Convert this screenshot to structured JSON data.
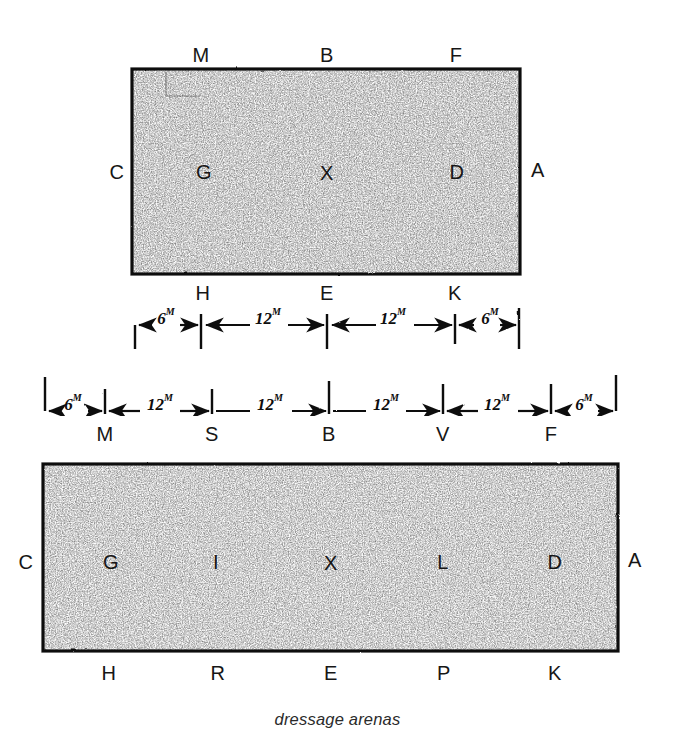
{
  "figure": {
    "caption": "dressage arenas",
    "caption_y": 718
  },
  "arena_small": {
    "name": "20m x 40m short dressage arena",
    "rect": {
      "x": 132,
      "y": 69,
      "w": 388,
      "h": 205
    },
    "letters_top": [
      {
        "label": "M",
        "x": 201,
        "y": 55
      },
      {
        "label": "B",
        "x": 327,
        "y": 55
      },
      {
        "label": "F",
        "x": 456,
        "y": 55
      }
    ],
    "letters_middle": [
      {
        "label": "C",
        "x": 117,
        "y": 172
      },
      {
        "label": "G",
        "x": 204,
        "y": 172
      },
      {
        "label": "X",
        "x": 327,
        "y": 173
      },
      {
        "label": "D",
        "x": 457,
        "y": 172
      },
      {
        "label": "A",
        "x": 538,
        "y": 170
      }
    ],
    "letters_bottom": [
      {
        "label": "H",
        "x": 203,
        "y": 293
      },
      {
        "label": "E",
        "x": 327,
        "y": 293
      },
      {
        "label": "K",
        "x": 455,
        "y": 293
      }
    ]
  },
  "arena_large": {
    "name": "20m x 60m standard dressage arena",
    "rect": {
      "x": 43,
      "y": 464,
      "w": 575,
      "h": 187
    },
    "letters_middle": [
      {
        "label": "C",
        "x": 26,
        "y": 562
      },
      {
        "label": "G",
        "x": 111,
        "y": 562
      },
      {
        "label": "I",
        "x": 216,
        "y": 562
      },
      {
        "label": "X",
        "x": 331,
        "y": 563
      },
      {
        "label": "L",
        "x": 443,
        "y": 562
      },
      {
        "label": "D",
        "x": 555,
        "y": 562
      },
      {
        "label": "A",
        "x": 635,
        "y": 560
      }
    ],
    "letters_bottom": [
      {
        "label": "H",
        "x": 109,
        "y": 673
      },
      {
        "label": "R",
        "x": 218,
        "y": 673
      },
      {
        "label": "E",
        "x": 331,
        "y": 673
      },
      {
        "label": "P",
        "x": 444,
        "y": 673
      },
      {
        "label": "K",
        "x": 555,
        "y": 673
      }
    ]
  },
  "dimension_row_short": {
    "name": "short-arena-long-side-dimensions",
    "baseline_y": 325,
    "ticks_x": [
      135,
      201,
      327,
      455,
      519
    ],
    "tick_dir": "down",
    "tick_len": 22,
    "segments": [
      {
        "value": "6",
        "unit": "M",
        "x1": 135,
        "x2": 201,
        "label_x": 166,
        "label_y": 318
      },
      {
        "value": "12",
        "unit": "M",
        "x1": 201,
        "x2": 327,
        "label_x": 268,
        "label_y": 318
      },
      {
        "value": "12",
        "unit": "M",
        "x1": 327,
        "x2": 455,
        "label_x": 393,
        "label_y": 318
      },
      {
        "value": "6",
        "unit": "M",
        "x1": 455,
        "x2": 519,
        "label_x": 490,
        "label_y": 318
      }
    ],
    "letters_above": [
      {
        "label": "H",
        "x": 203,
        "y": 293
      },
      {
        "label": "E",
        "x": 327,
        "y": 293
      },
      {
        "label": "K",
        "x": 455,
        "y": 293
      }
    ]
  },
  "dimension_row_long": {
    "name": "long-arena-long-side-dimensions",
    "baseline_y": 411,
    "ticks_x": [
      45,
      105,
      212,
      329,
      443,
      551,
      616
    ],
    "tick_dir": "up",
    "tick_len": 34,
    "segments": [
      {
        "value": "6",
        "unit": "M",
        "x1": 45,
        "x2": 105,
        "label_x": 73,
        "label_y": 404
      },
      {
        "value": "12",
        "unit": "M",
        "x1": 105,
        "x2": 212,
        "label_x": 160,
        "label_y": 404
      },
      {
        "value": "12",
        "unit": "M",
        "x1": 212,
        "x2": 329,
        "label_x": 270,
        "label_y": 404
      },
      {
        "value": "12",
        "unit": "M",
        "x1": 329,
        "x2": 443,
        "label_x": 386,
        "label_y": 404
      },
      {
        "value": "12",
        "unit": "M",
        "x1": 443,
        "x2": 551,
        "label_x": 497,
        "label_y": 404
      },
      {
        "value": "6",
        "unit": "M",
        "x1": 551,
        "x2": 616,
        "label_x": 584,
        "label_y": 404
      }
    ],
    "letters_below": [
      {
        "label": "M",
        "x": 105,
        "y": 434
      },
      {
        "label": "S",
        "x": 212,
        "y": 434
      },
      {
        "label": "B",
        "x": 329,
        "y": 434
      },
      {
        "label": "V",
        "x": 443,
        "y": 434
      },
      {
        "label": "F",
        "x": 551,
        "y": 434
      }
    ]
  },
  "style": {
    "ink": "#111111",
    "paper": "#ffffff",
    "fill_tone": "#d8d8d8"
  }
}
